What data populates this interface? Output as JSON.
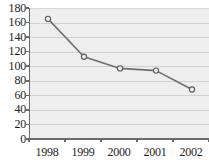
{
  "chart_data": {
    "type": "line",
    "title": "",
    "subtitle": "",
    "xlabel": "",
    "ylabel": "",
    "categories": [
      "1998",
      "1999",
      "2000",
      "2001",
      "2002"
    ],
    "values": [
      165,
      113,
      97,
      94,
      68
    ],
    "series": [
      {
        "name": "series-1",
        "values": [
          165,
          113,
          97,
          94,
          68
        ]
      }
    ],
    "ylim": [
      0,
      180
    ],
    "yticks": [
      0,
      20,
      40,
      60,
      80,
      100,
      120,
      140,
      160,
      180
    ],
    "ytick_labels": [
      "0",
      "20",
      "40",
      "60",
      "80",
      "100",
      "120",
      "140",
      "160",
      "180"
    ],
    "xtick_labels": [
      "1998",
      "1999",
      "2000",
      "2001",
      "2002"
    ],
    "grid": "horizontal",
    "legend": "none",
    "annotations": [],
    "colors": {
      "plot_background": "#eeeeee",
      "figure_background": "#ffffff",
      "gridline": "#d2d2d2",
      "axis": "#6b6b6b",
      "line": "#6e6e6e",
      "marker_fill": "#eeeeee",
      "marker_edge": "#5a5a5a",
      "tick_label": "#1c1c1c"
    },
    "marker": "open-circle"
  }
}
